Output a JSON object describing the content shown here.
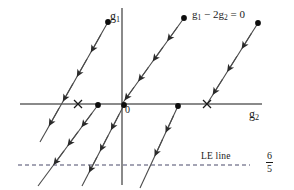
{
  "figure": {
    "title_label": "phase-portrait",
    "background_color": "#ffffff",
    "axis_color": "#808080",
    "trajectory_color": "#3a3a3a",
    "marker_color": "#000000",
    "dashed_line_color": "#4a4a6a",
    "width": 294,
    "height": 190
  },
  "labels": {
    "y_axis": "g",
    "y_axis_sub": "1",
    "x_axis": "g",
    "x_axis_sub": "2",
    "origin": "0",
    "equation_part1": "g",
    "equation_sub1": "1",
    "equation_minus": " − 2",
    "equation_part2": "g",
    "equation_sub2": "2",
    "equation_end": " = 0",
    "equation_full": "g1 - 2g2 = 0",
    "le_line": "LE line",
    "fraction_numerator": "6",
    "fraction_denominator": "5",
    "fraction_full": "6/5"
  },
  "axes": {
    "x_axis": {
      "y": 104,
      "x_start": 20,
      "x_end": 262
    },
    "y_axis": {
      "x": 122,
      "y_start": 8,
      "y_end": 185
    }
  },
  "le_line": {
    "y": 165,
    "x_start": 18,
    "x_end": 250,
    "dash": "4,3"
  },
  "trajectories": [
    {
      "name": "upper-left-branch",
      "x1": 40,
      "y1": 142,
      "x2": 108,
      "y2": 22,
      "arrow_dir": "down-left",
      "arrow_count": 4,
      "end_dot": "top"
    },
    {
      "name": "middle-upper-branch",
      "x1": 122,
      "y1": 104,
      "x2": 184,
      "y2": 18,
      "arrow_dir": "down-left",
      "arrow_count": 4,
      "end_dot": "top"
    },
    {
      "name": "right-upper-branch",
      "x1": 207,
      "y1": 104,
      "x2": 258,
      "y2": 23,
      "arrow_dir": "down-left",
      "arrow_count": 3,
      "end_dot": "top"
    },
    {
      "name": "lower-left-branch",
      "x1": 38,
      "y1": 186,
      "x2": 98,
      "y2": 105,
      "arrow_dir": "down-left",
      "arrow_count": 3,
      "end_dot": "top"
    },
    {
      "name": "lower-middle-branch",
      "x1": 82,
      "y1": 186,
      "x2": 124,
      "y2": 105,
      "arrow_dir": "down-left",
      "arrow_count": 3,
      "end_dot": "top"
    },
    {
      "name": "lower-right-branch",
      "x1": 140,
      "y1": 188,
      "x2": 178,
      "y2": 106,
      "arrow_dir": "down-left",
      "arrow_count": 2,
      "end_dot": "top"
    }
  ],
  "fixed_points": [
    {
      "name": "equilibrium-left",
      "x": 78,
      "y": 104,
      "marker": "x"
    },
    {
      "name": "equilibrium-right",
      "x": 207,
      "y": 104,
      "marker": "x"
    }
  ],
  "dots": [
    {
      "name": "dot-upper-left",
      "x": 108,
      "y": 22
    },
    {
      "name": "dot-upper-middle",
      "x": 184,
      "y": 18
    },
    {
      "name": "dot-upper-right",
      "x": 258,
      "y": 23
    },
    {
      "name": "dot-axis-left",
      "x": 98,
      "y": 105
    },
    {
      "name": "dot-axis-origin",
      "x": 124,
      "y": 105
    },
    {
      "name": "dot-axis-right",
      "x": 178,
      "y": 106
    }
  ]
}
